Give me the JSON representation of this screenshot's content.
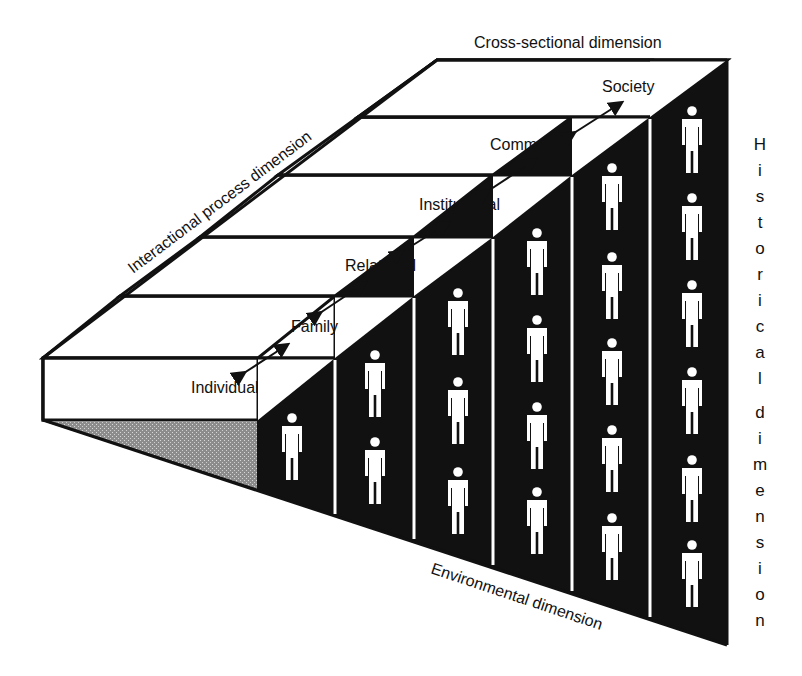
{
  "diagram": {
    "dimensions": {
      "top": "Cross-sectional dimension",
      "left": "Interactional process dimension",
      "bottom": "Environmental dimension",
      "right": "Historical dimension",
      "right_letters": [
        "H",
        "i",
        "s",
        "t",
        "o",
        "r",
        "i",
        "c",
        "a",
        "l",
        "",
        "d",
        "i",
        "m",
        "e",
        "n",
        "s",
        "i",
        "o",
        "n"
      ]
    },
    "levels": [
      {
        "label": "Individual",
        "figures": 1
      },
      {
        "label": "Family",
        "figures": 2
      },
      {
        "label": "Relational",
        "figures": 3
      },
      {
        "label": "Institutional",
        "figures": 4
      },
      {
        "label": "Community",
        "figures": 5
      },
      {
        "label": "Society",
        "figures": 6
      }
    ],
    "colors": {
      "ink": "#111111",
      "paper": "#ffffff",
      "shade": "#9a9a9a"
    },
    "icons": {
      "person": "person-icon",
      "arrow": "double-arrow-icon"
    }
  }
}
